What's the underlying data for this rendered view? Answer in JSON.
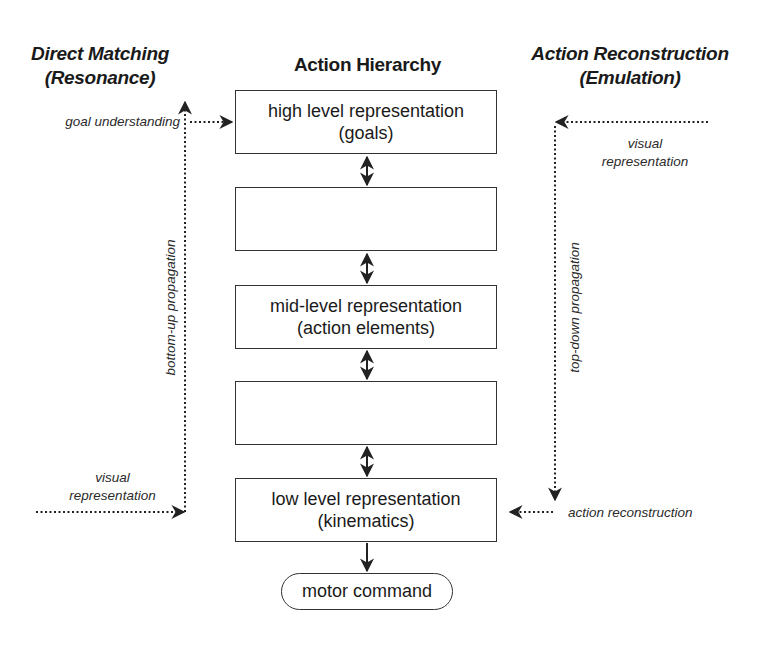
{
  "headings": {
    "left_line1": "Direct Matching",
    "left_line2": "(Resonance)",
    "center": "Action Hierarchy",
    "right_line1": "Action Reconstruction",
    "right_line2": "(Emulation)"
  },
  "hierarchy": {
    "boxes": [
      {
        "line1": "high level representation",
        "line2": "(goals)"
      },
      {
        "line1": "",
        "line2": ""
      },
      {
        "line1": "mid-level representation",
        "line2": "(action elements)"
      },
      {
        "line1": "",
        "line2": ""
      },
      {
        "line1": "low level representation",
        "line2": "(kinematics)"
      }
    ],
    "output": "motor command"
  },
  "left_pathway": {
    "top_label": "goal understanding",
    "vertical_label": "bottom-up propagation",
    "bottom_label_line1": "visual",
    "bottom_label_line2": "representation"
  },
  "right_pathway": {
    "top_label_line1": "visual",
    "top_label_line2": "representation",
    "vertical_label": "top-down propagation",
    "bottom_label": "action reconstruction"
  },
  "colors": {
    "stroke": "#333333",
    "text": "#1a1a1a",
    "background": "#ffffff"
  }
}
